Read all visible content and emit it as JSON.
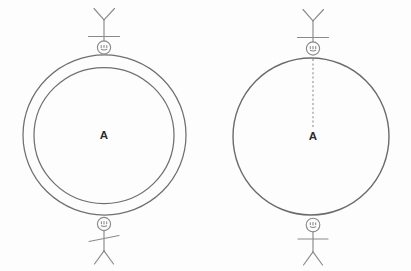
{
  "diagram": {
    "background_color": "#fdfdfd",
    "stroke_color": "#6f6f6f",
    "label_color": "#2b2b2b",
    "panels": [
      {
        "id": "left",
        "name": "annulus-panel",
        "center_label": "A",
        "shape": "concentric-circles",
        "outer_circle": {
          "cx": 104.5,
          "cy": 135,
          "r": 81
        },
        "inner_circle": {
          "cx": 104,
          "cy": 135.5,
          "r": 69
        },
        "observers": [
          {
            "id": "top",
            "orientation": "inverted",
            "x": 104,
            "y": 47
          },
          {
            "id": "bottom",
            "orientation": "upright",
            "x": 104,
            "y": 224
          }
        ],
        "radius_line": false
      },
      {
        "id": "right",
        "name": "single-circle-panel",
        "center_label": "A",
        "shape": "single-circle",
        "outer_circle": {
          "cx": 311,
          "cy": 136.5,
          "r": 78
        },
        "observers": [
          {
            "id": "top",
            "orientation": "inverted",
            "x": 313,
            "y": 48
          },
          {
            "id": "bottom",
            "orientation": "upright",
            "x": 313,
            "y": 225
          }
        ],
        "radius_line": true,
        "radius_line_from": {
          "x": 313,
          "y": 59
        },
        "radius_line_to": {
          "x": 313,
          "y": 128
        },
        "radius_line_style": "dotted"
      }
    ]
  }
}
